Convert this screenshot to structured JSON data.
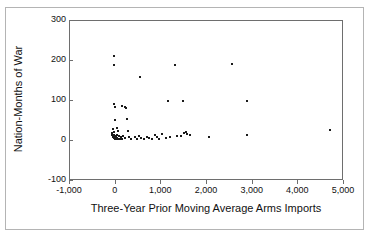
{
  "chart_data": {
    "type": "scatter",
    "title": "",
    "xlabel": "Three-Year Prior Moving Average Arms Imports",
    "ylabel": "Nation-Months of War",
    "xlim": [
      -1000,
      5000
    ],
    "ylim": [
      -100,
      300
    ],
    "xticks": [
      -1000,
      0,
      1000,
      2000,
      3000,
      4000,
      5000
    ],
    "xticklabels": [
      "-1,000",
      "0",
      "1,000",
      "2,000",
      "3,000",
      "4,000",
      "5,000"
    ],
    "yticks": [
      -100,
      0,
      100,
      200,
      300
    ],
    "yticklabels": [
      "-100",
      "0",
      "100",
      "200",
      "300"
    ],
    "grid": false,
    "legend": null,
    "marker": "square",
    "marker_color": "#1a1a1a",
    "points": [
      {
        "x": -30,
        "y": 212
      },
      {
        "x": -30,
        "y": 190
      },
      {
        "x": 530,
        "y": 160
      },
      {
        "x": 1290,
        "y": 191
      },
      {
        "x": 2540,
        "y": 193
      },
      {
        "x": -40,
        "y": 93
      },
      {
        "x": -20,
        "y": 86
      },
      {
        "x": 130,
        "y": 88
      },
      {
        "x": 200,
        "y": 86
      },
      {
        "x": 220,
        "y": 83
      },
      {
        "x": 1480,
        "y": 100
      },
      {
        "x": 2880,
        "y": 101
      },
      {
        "x": -20,
        "y": 53
      },
      {
        "x": 240,
        "y": 56
      },
      {
        "x": 1150,
        "y": 100
      },
      {
        "x": -60,
        "y": 30
      },
      {
        "x": -40,
        "y": 23
      },
      {
        "x": 40,
        "y": 33
      },
      {
        "x": 60,
        "y": 25
      },
      {
        "x": 4700,
        "y": 27
      },
      {
        "x": -90,
        "y": 20
      },
      {
        "x": -70,
        "y": 15
      },
      {
        "x": -60,
        "y": 11
      },
      {
        "x": -50,
        "y": 9
      },
      {
        "x": -40,
        "y": 14
      },
      {
        "x": -30,
        "y": 7
      },
      {
        "x": -20,
        "y": 12
      },
      {
        "x": -10,
        "y": 5
      },
      {
        "x": 0,
        "y": 10
      },
      {
        "x": 10,
        "y": 6
      },
      {
        "x": 20,
        "y": 14
      },
      {
        "x": 30,
        "y": 8
      },
      {
        "x": 50,
        "y": 4
      },
      {
        "x": 70,
        "y": 12
      },
      {
        "x": 90,
        "y": 6
      },
      {
        "x": 110,
        "y": 9
      },
      {
        "x": 140,
        "y": 5
      },
      {
        "x": 170,
        "y": 13
      },
      {
        "x": 210,
        "y": 7
      },
      {
        "x": 260,
        "y": 24
      },
      {
        "x": 300,
        "y": 10
      },
      {
        "x": 340,
        "y": 6
      },
      {
        "x": 420,
        "y": 9
      },
      {
        "x": 470,
        "y": 4
      },
      {
        "x": 520,
        "y": 12
      },
      {
        "x": 560,
        "y": 7
      },
      {
        "x": 620,
        "y": 5
      },
      {
        "x": 680,
        "y": 11
      },
      {
        "x": 740,
        "y": 8
      },
      {
        "x": 800,
        "y": 6
      },
      {
        "x": 860,
        "y": 14
      },
      {
        "x": 900,
        "y": 9
      },
      {
        "x": 950,
        "y": 5
      },
      {
        "x": 1020,
        "y": 18
      },
      {
        "x": 1100,
        "y": 7
      },
      {
        "x": 1180,
        "y": 10
      },
      {
        "x": 1340,
        "y": 13
      },
      {
        "x": 1420,
        "y": 12
      },
      {
        "x": 1500,
        "y": 20
      },
      {
        "x": 1530,
        "y": 22
      },
      {
        "x": 1560,
        "y": 18
      },
      {
        "x": 1620,
        "y": 15
      },
      {
        "x": 2050,
        "y": 11
      },
      {
        "x": 2880,
        "y": 16
      }
    ]
  },
  "axes": {
    "yticks": [
      {
        "label": "300",
        "value": 300
      },
      {
        "label": "200",
        "value": 200
      },
      {
        "label": "100",
        "value": 100
      },
      {
        "label": "0",
        "value": 0
      },
      {
        "label": "-100",
        "value": -100
      }
    ],
    "xticks": [
      {
        "label": "-1,000",
        "value": -1000
      },
      {
        "label": "0",
        "value": 0
      },
      {
        "label": "1,000",
        "value": 1000
      },
      {
        "label": "2,000",
        "value": 2000
      },
      {
        "label": "3,000",
        "value": 3000
      },
      {
        "label": "4,000",
        "value": 4000
      },
      {
        "label": "5,000",
        "value": 5000
      }
    ]
  }
}
